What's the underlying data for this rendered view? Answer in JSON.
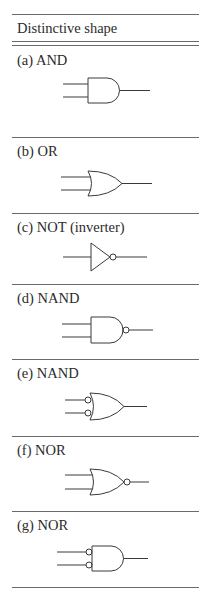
{
  "table": {
    "header": "Distinctive shape",
    "rows": [
      {
        "label": "(a) AND",
        "gate": "and-gate"
      },
      {
        "label": "(b) OR",
        "gate": "or-gate"
      },
      {
        "label": "(c) NOT (inverter)",
        "gate": "not-gate"
      },
      {
        "label": "(d) NAND",
        "gate": "nand-gate"
      },
      {
        "label": "(e) NAND",
        "gate": "or-gate-inverted-inputs"
      },
      {
        "label": "(f) NOR",
        "gate": "nor-gate"
      },
      {
        "label": "(g) NOR",
        "gate": "and-gate-inverted-inputs"
      }
    ]
  }
}
